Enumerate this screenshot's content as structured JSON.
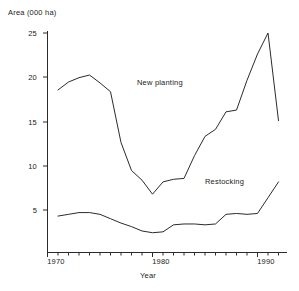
{
  "chart_data": {
    "type": "line",
    "title": "",
    "xlabel": "Year",
    "ylabel": "Area (000 ha)",
    "xlim": [
      1970.8,
      1992.5
    ],
    "ylim": [
      0,
      25
    ],
    "grid": false,
    "legend_position": "inline-annotation",
    "y_ticks": [
      0,
      5,
      10,
      15,
      20,
      25
    ],
    "y_tick_labels": [
      "",
      "5",
      "10",
      "15",
      "20",
      "25"
    ],
    "x_ticks": [
      1970,
      1971,
      1972,
      1973,
      1974,
      1975,
      1976,
      1977,
      1978,
      1979,
      1980,
      1981,
      1982,
      1983,
      1984,
      1985,
      1986,
      1987,
      1988,
      1989,
      1990,
      1991,
      1992
    ],
    "x_tick_labels": [
      "1970",
      "",
      "",
      "",
      "",
      "",
      "",
      "",
      "",
      "",
      "1980",
      "",
      "",
      "",
      "",
      "",
      "",
      "",
      "",
      "",
      "1990",
      "",
      ""
    ],
    "x_major_labels": [
      "1970",
      "1980",
      "1990"
    ],
    "annotations": [
      {
        "text": "New planting",
        "x": 1983.5,
        "y": 16.8
      },
      {
        "text": "Restocking",
        "x": 1990.0,
        "y": 6.0
      }
    ],
    "series": [
      {
        "name": "New planting",
        "x": [
          1971,
          1972,
          1973,
          1974,
          1975,
          1976,
          1977,
          1978,
          1979,
          1980,
          1981,
          1982,
          1983,
          1984,
          1985,
          1986,
          1987,
          1988,
          1989,
          1990,
          1991,
          1992
        ],
        "values": [
          18.5,
          19.4,
          19.9,
          20.2,
          19.3,
          18.3,
          12.5,
          9.3,
          8.2,
          6.6,
          8.0,
          8.3,
          8.4,
          11.0,
          13.2,
          14.0,
          16.0,
          16.2,
          19.6,
          22.6,
          25.0,
          15.0
        ]
      },
      {
        "name": "Restocking",
        "x": [
          1971,
          1972,
          1973,
          1974,
          1975,
          1976,
          1977,
          1978,
          1979,
          1980,
          1981,
          1982,
          1983,
          1984,
          1985,
          1986,
          1987,
          1988,
          1989,
          1990,
          1991,
          1992
        ],
        "values": [
          4.1,
          4.3,
          4.5,
          4.5,
          4.3,
          3.8,
          3.3,
          2.9,
          2.4,
          2.2,
          2.3,
          3.1,
          3.2,
          3.2,
          3.1,
          3.2,
          4.3,
          4.4,
          4.3,
          4.4,
          6.2,
          8.0
        ]
      }
    ],
    "axis_color": "#2b2b2b",
    "series_colors": [
      "#2b2b2b",
      "#2b2b2b"
    ]
  },
  "figure": {
    "y_axis_title": "Area (000 ha)",
    "x_axis_title": "Year",
    "series_label_new_planting": "New planting",
    "series_label_restocking": "Restocking",
    "ytick_25": "25",
    "ytick_20": "20",
    "ytick_15": "15",
    "ytick_10": "10",
    "ytick_5": "5",
    "xtick_1970": "1970",
    "xtick_1980": "1980",
    "xtick_1990": "1990"
  }
}
